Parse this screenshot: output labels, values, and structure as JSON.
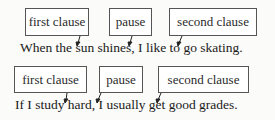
{
  "example1": {
    "labels": [
      "first clause",
      "pause",
      "second clause"
    ],
    "sentence": "When the sun shines, I like to go skating."
  },
  "example2": {
    "labels": [
      "first clause",
      "pause",
      "second clause"
    ],
    "sentence": "If I study hard, I usually get good grades."
  }
}
